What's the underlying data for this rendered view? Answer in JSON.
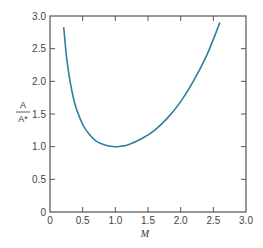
{
  "chart_data": {
    "type": "line",
    "title": "",
    "xlabel": "M",
    "ylabel_numerator": "A",
    "ylabel_denominator": "A*",
    "xlim": [
      0,
      3.0
    ],
    "ylim": [
      0,
      3.0
    ],
    "xticks": [
      "0",
      "0.5",
      "1.0",
      "1.5",
      "2.0",
      "2.5",
      "3.0"
    ],
    "yticks": [
      "0",
      "0.5",
      "1.0",
      "1.5",
      "2.0",
      "2.5",
      "3.0"
    ],
    "grid": false,
    "series": [
      {
        "name": "A/A*",
        "color": "#2e7fa0",
        "x": [
          0.21,
          0.25,
          0.3,
          0.35,
          0.4,
          0.5,
          0.6,
          0.7,
          0.8,
          0.9,
          1.0,
          1.1,
          1.2,
          1.4,
          1.6,
          1.8,
          2.0,
          2.2,
          2.4,
          2.6
        ],
        "values": [
          2.83,
          2.4,
          2.04,
          1.78,
          1.59,
          1.34,
          1.19,
          1.09,
          1.04,
          1.01,
          1.0,
          1.01,
          1.03,
          1.12,
          1.25,
          1.44,
          1.69,
          2.01,
          2.4,
          2.9
        ]
      }
    ]
  }
}
